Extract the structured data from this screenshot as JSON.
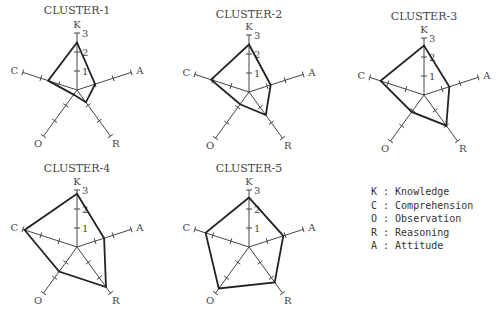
{
  "chart_data": {
    "type": "radar",
    "scale": {
      "min": 0,
      "max": 3,
      "ticks": [
        1,
        2,
        3
      ]
    },
    "axes": [
      "K",
      "A",
      "R",
      "O",
      "C"
    ],
    "charts": [
      {
        "title": "CLUSTER-1",
        "values": {
          "K": 2.5,
          "A": 1.0,
          "R": 0.8,
          "O": 0.3,
          "C": 1.6
        }
      },
      {
        "title": "CLUSTER-2",
        "values": {
          "K": 2.5,
          "A": 1.2,
          "R": 1.5,
          "O": 0.8,
          "C": 2.1
        }
      },
      {
        "title": "CLUSTER-3",
        "values": {
          "K": 2.6,
          "A": 1.4,
          "R": 2.0,
          "O": 1.1,
          "C": 2.4
        }
      },
      {
        "title": "CLUSTER-4",
        "values": {
          "K": 2.8,
          "A": 1.5,
          "R": 2.6,
          "O": 1.6,
          "C": 2.9
        }
      },
      {
        "title": "CLUSTER-5",
        "values": {
          "K": 2.6,
          "A": 1.9,
          "R": 2.3,
          "O": 2.7,
          "C": 2.4
        }
      }
    ],
    "legend": [
      {
        "key": "K",
        "label": "Knowledge"
      },
      {
        "key": "C",
        "label": "Comprehension"
      },
      {
        "key": "O",
        "label": "Observation"
      },
      {
        "key": "R",
        "label": "Reasoning"
      },
      {
        "key": "A",
        "label": "Attitude"
      }
    ]
  },
  "layout": {
    "positions": [
      {
        "cx": 77,
        "cy": 90,
        "title_x": 40,
        "title_y": 4
      },
      {
        "cx": 249,
        "cy": 92,
        "title_x": 212,
        "title_y": 8
      },
      {
        "cx": 424,
        "cy": 95,
        "title_x": 390,
        "title_y": 10
      },
      {
        "cx": 77,
        "cy": 247,
        "title_x": 42,
        "title_y": 162
      },
      {
        "cx": 249,
        "cy": 247,
        "title_x": 213,
        "title_y": 162
      }
    ],
    "unit_px": 19
  },
  "legend_lines": [
    "K : Knowledge",
    "C : Comprehension",
    "O : Observation",
    "R : Reasoning",
    "A : Attitude"
  ]
}
